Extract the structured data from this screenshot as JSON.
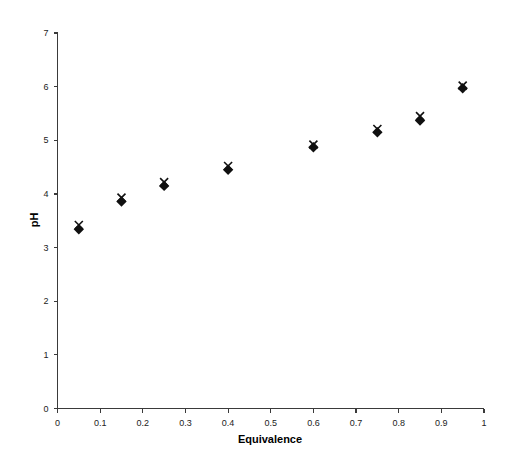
{
  "chart_data": {
    "type": "scatter",
    "title": "",
    "xlabel": "Equivalence",
    "ylabel": "pH",
    "xlim": [
      0,
      1
    ],
    "ylim": [
      0,
      7
    ],
    "grid": false,
    "legend": null,
    "x_ticks": [
      "0",
      "0.1",
      "0.2",
      "0.3",
      "0.4",
      "0.5",
      "0.6",
      "0.7",
      "0.8",
      "0.9",
      "1"
    ],
    "x_tick_values": [
      0,
      0.1,
      0.2,
      0.3,
      0.4,
      0.5,
      0.6,
      0.7,
      0.8,
      0.9,
      1
    ],
    "y_ticks": [
      "0",
      "1",
      "2",
      "3",
      "4",
      "5",
      "6",
      "7"
    ],
    "y_tick_values": [
      0,
      1,
      2,
      3,
      4,
      5,
      6,
      7
    ],
    "x": [
      0.05,
      0.15,
      0.25,
      0.4,
      0.6,
      0.75,
      0.85,
      0.95
    ],
    "series": [
      {
        "name": "series-diamond",
        "marker": "diamond",
        "color": "#101010",
        "values": [
          3.34,
          3.86,
          4.15,
          4.45,
          4.87,
          5.15,
          5.37,
          5.97
        ]
      },
      {
        "name": "series-cross",
        "marker": "x",
        "color": "#101010",
        "values": [
          3.42,
          3.93,
          4.22,
          4.52,
          4.92,
          5.21,
          5.45,
          6.02
        ]
      }
    ]
  }
}
